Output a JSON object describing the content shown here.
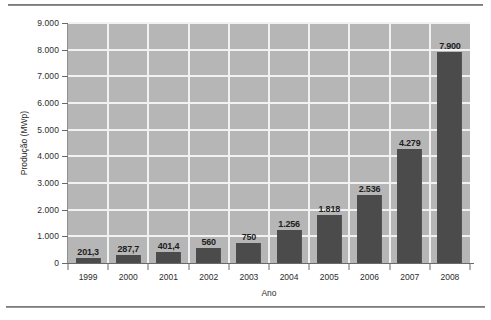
{
  "chart_data": {
    "type": "bar",
    "title": "",
    "xlabel": "Ano",
    "ylabel": "Produção (MWp)",
    "categories": [
      "1999",
      "2000",
      "2001",
      "2002",
      "2003",
      "2004",
      "2005",
      "2006",
      "2007",
      "2008"
    ],
    "values": [
      201.3,
      287.7,
      401.4,
      560,
      750,
      1256,
      1818,
      2536,
      4279,
      7900
    ],
    "data_labels": [
      "201,3",
      "287,7",
      "401,4",
      "560",
      "750",
      "1.256",
      "1.818",
      "2.536",
      "4.279",
      "7.900"
    ],
    "ylim": [
      0,
      9000
    ],
    "ytick_labels": [
      "0",
      "1.000",
      "2.000",
      "3.000",
      "4.000",
      "5.000",
      "6.000",
      "7.000",
      "8.000",
      "9.000"
    ],
    "ytick_values": [
      0,
      1000,
      2000,
      3000,
      4000,
      5000,
      6000,
      7000,
      8000,
      9000
    ],
    "grid": true,
    "legend": "none",
    "colors": {
      "bar": "#4b4b4b",
      "plot_background": "#b6b6b6",
      "gridline": "#f2f2f2",
      "axis": "#6a6a6a",
      "text": "#2c2c2c",
      "page_background": "#ffffff"
    }
  }
}
